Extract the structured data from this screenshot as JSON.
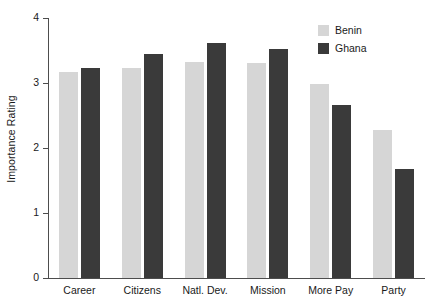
{
  "chart_data": {
    "type": "bar",
    "title": "",
    "subtitle": "",
    "xlabel": "",
    "ylabel": "Importance Rating",
    "categories": [
      "Career",
      "Citizens",
      "Natl. Dev.",
      "Mission",
      "More Pay",
      "Party"
    ],
    "series": [
      {
        "name": "Benin",
        "color": "#d6d6d6",
        "values": [
          3.17,
          3.23,
          3.33,
          3.31,
          2.98,
          2.27
        ]
      },
      {
        "name": "Ghana",
        "color": "#3a3a3a",
        "values": [
          3.23,
          3.45,
          3.61,
          3.53,
          2.66,
          1.67
        ]
      }
    ],
    "ylim": [
      0,
      4
    ],
    "ytick_labels": [
      "0",
      "1",
      "2",
      "3",
      "4"
    ],
    "ytick_values": [
      0,
      1,
      2,
      3,
      4
    ],
    "grid": false,
    "legend_position": "top-right",
    "legend_entries": [
      {
        "label": "Benin",
        "color": "#d6d6d6"
      },
      {
        "label": "Ghana",
        "color": "#3a3a3a"
      }
    ]
  }
}
